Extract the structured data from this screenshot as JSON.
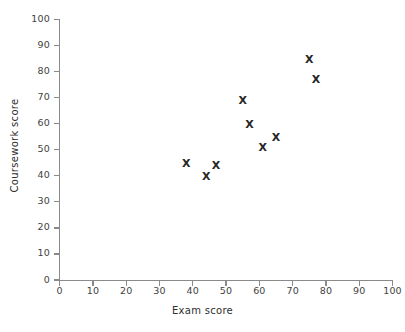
{
  "chart_data": {
    "type": "scatter",
    "title": "",
    "xlabel": "Exam score",
    "ylabel": "Coursework score",
    "xlim": [
      0,
      100
    ],
    "ylim": [
      0,
      100
    ],
    "xticks": [
      0,
      10,
      20,
      30,
      40,
      50,
      60,
      70,
      80,
      90,
      100
    ],
    "yticks": [
      0,
      10,
      20,
      30,
      40,
      50,
      60,
      70,
      80,
      90,
      100
    ],
    "grid": false,
    "legend": null,
    "marker": "x",
    "marker_color": "#262626",
    "axis_color": "#8a8a8a",
    "background": "#ffffff",
    "series": [
      {
        "name": "students",
        "points": [
          {
            "x": 38,
            "y": 45
          },
          {
            "x": 44,
            "y": 40
          },
          {
            "x": 47,
            "y": 44
          },
          {
            "x": 55,
            "y": 69
          },
          {
            "x": 57,
            "y": 60
          },
          {
            "x": 61,
            "y": 51
          },
          {
            "x": 65,
            "y": 55
          },
          {
            "x": 75,
            "y": 85
          },
          {
            "x": 77,
            "y": 77
          }
        ]
      }
    ]
  },
  "marker_glyph": "X"
}
